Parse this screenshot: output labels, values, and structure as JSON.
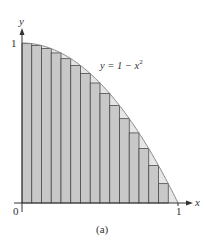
{
  "chart_data": {
    "type": "area",
    "title": "",
    "function": "y = 1 - x^2",
    "curve_label": "y = 1 − x",
    "curve_label_exp": "2",
    "xlabel": "x",
    "ylabel": "y",
    "xlim": [
      0,
      1
    ],
    "ylim": [
      0,
      1
    ],
    "x_ticks": [
      "0",
      "1"
    ],
    "y_ticks": [
      "1"
    ],
    "caption": "(a)",
    "rectangles": {
      "n": 16,
      "rule": "right endpoint (inscribed)",
      "width": 0.0625,
      "x_left": [
        0,
        0.0625,
        0.125,
        0.1875,
        0.25,
        0.3125,
        0.375,
        0.4375,
        0.5,
        0.5625,
        0.625,
        0.6875,
        0.75,
        0.8125,
        0.875,
        0.9375
      ],
      "heights": [
        0.996,
        0.984,
        0.965,
        0.938,
        0.902,
        0.859,
        0.809,
        0.75,
        0.684,
        0.609,
        0.527,
        0.438,
        0.34,
        0.234,
        0.121,
        0.0
      ]
    },
    "colors": {
      "rect_fill": "#c8c8c8",
      "rect_stroke": "#4a4a4a",
      "curve": "#8a8a8a",
      "gap_fill": "#e6e6e6",
      "axis": "#333333"
    }
  }
}
